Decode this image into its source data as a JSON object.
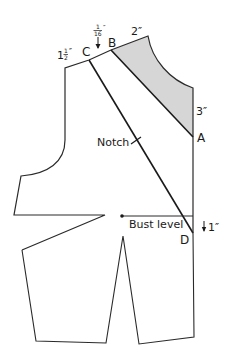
{
  "diagram": {
    "type": "sewing-pattern",
    "colors": {
      "line": "#2a2a2a",
      "shade": "#d4d4d4",
      "background": "#ffffff"
    },
    "points": {
      "A": "A",
      "B": "B",
      "C": "C",
      "D": "D"
    },
    "measurements": {
      "shoulder_left": "1½″",
      "shoulder_left_whole": "1",
      "shoulder_left_frac_num": "1",
      "shoulder_left_frac_den": "2",
      "shoulder_left_unit": "″",
      "offset_top_num": "1",
      "offset_top_den": "16",
      "offset_top_unit": "″",
      "offset_top": "1/16″",
      "neck_width": "2″",
      "center_drop": "3″",
      "bust_drop": "1″"
    },
    "labels": {
      "notch": "Notch",
      "bust_level": "Bust level"
    }
  }
}
